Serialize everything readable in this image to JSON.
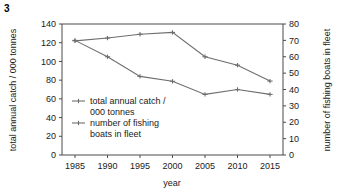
{
  "figure": {
    "number": "3"
  },
  "chart_data": {
    "type": "line",
    "title": "",
    "xlabel": "year",
    "ylabel": "total annual catch / 000 tonnes",
    "y2label": "number of fishing boats in fleet",
    "grid": false,
    "legend_position": "inside-left",
    "x": [
      1985,
      1990,
      1995,
      2000,
      2005,
      2010,
      2015
    ],
    "xtick_labels": [
      "1985",
      "1990",
      "1995",
      "2000",
      "2005",
      "2010",
      "2015"
    ],
    "xlim": [
      1983,
      2017
    ],
    "ylim": [
      0,
      140
    ],
    "ytick_labels": [
      "0",
      "20",
      "40",
      "60",
      "80",
      "100",
      "120",
      "140"
    ],
    "ytick_values": [
      0,
      20,
      40,
      60,
      80,
      100,
      120,
      140
    ],
    "y2lim": [
      0,
      80
    ],
    "y2tick_labels": [
      "0",
      "10",
      "20",
      "30",
      "40",
      "50",
      "60",
      "70",
      "80"
    ],
    "y2tick_values": [
      0,
      10,
      20,
      30,
      40,
      50,
      60,
      70,
      80
    ],
    "series": [
      {
        "name": "total annual catch / 000 tonnes",
        "axis": "left",
        "color": "#6e6e6e",
        "values": [
          122,
          125,
          129,
          131,
          105,
          96,
          79
        ]
      },
      {
        "name": "number of fishing boats in fleet",
        "axis": "right",
        "color": "#6e6e6e",
        "values": [
          70,
          60,
          48,
          45,
          37,
          40,
          37
        ]
      }
    ],
    "legend": [
      {
        "line1": "total annual catch /",
        "line2": "000 tonnes"
      },
      {
        "line1": "number of fishing",
        "line2": "boats in fleet"
      }
    ]
  }
}
